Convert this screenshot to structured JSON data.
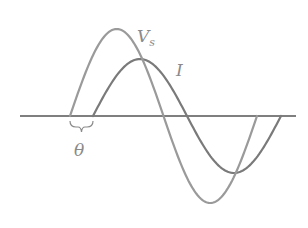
{
  "diagram": {
    "title": "",
    "type": "phase-shift-waveforms",
    "labels": {
      "voltage": "V",
      "voltage_subscript": "s",
      "current": "I",
      "phase_angle": "θ"
    },
    "colors": {
      "axis": "#555555",
      "voltage_wave": "#9a9a9a",
      "current_wave": "#7a7a7a",
      "labels": "#8a8a8a",
      "background": "#ffffff"
    },
    "waves": [
      {
        "name": "Vs",
        "start_x": 70,
        "end_x": 257,
        "amplitude": 87
      },
      {
        "name": "I",
        "start_x": 93,
        "end_x": 281,
        "amplitude": 57
      }
    ],
    "axis_y": 116
  }
}
